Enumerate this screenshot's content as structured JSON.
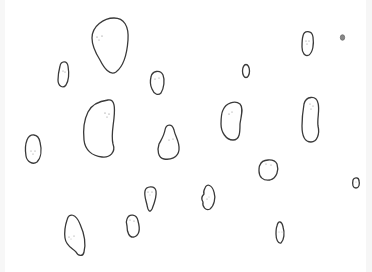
{
  "scene": {
    "description": "Hand-drawn outline blobs with tiny dot faces scattered on a white background",
    "background": "#ffffff",
    "stroke_color": "#3a3a3a",
    "blob_count": 18
  }
}
